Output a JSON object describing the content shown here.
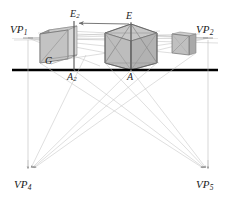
{
  "figure": {
    "kind": "perspective-construction-diagram",
    "width": 230,
    "height": 202,
    "background": "#ffffff"
  },
  "colors": {
    "ground_line": "#000000",
    "construction_line": "#b0b0b0",
    "cube_edge": "#6e6e6e",
    "cube_face_light": "#cfcfcf",
    "cube_face_mid": "#bdbdbd",
    "cube_face_dark": "#a8a8a8",
    "label_text": "#1a1a1a",
    "arrow": "#555555"
  },
  "labels": {
    "vp1": {
      "text": "VP",
      "sub": "1",
      "x": 10,
      "y": 24
    },
    "vp2": {
      "text": "VP",
      "sub": "2",
      "x": 196,
      "y": 24
    },
    "vp4": {
      "text": "VP",
      "sub": "4",
      "x": 14,
      "y": 179
    },
    "vp5": {
      "text": "VP",
      "sub": "5",
      "x": 196,
      "y": 179
    },
    "e_top": {
      "text": "E",
      "sub": "",
      "x": 126,
      "y": 13
    },
    "e2": {
      "text": "E",
      "sub": "2",
      "x": 71,
      "y": 11
    },
    "g": {
      "text": "G",
      "sub": "",
      "x": 46,
      "y": 57
    },
    "a2": {
      "text": "A",
      "sub": "2",
      "x": 68,
      "y": 72
    },
    "a": {
      "text": "A",
      "sub": "",
      "x": 128,
      "y": 72
    }
  },
  "points": {
    "VP1": {
      "x": 28,
      "y": 38
    },
    "VP2": {
      "x": 208,
      "y": 38
    },
    "VP4": {
      "x": 28,
      "y": 172
    },
    "VP5": {
      "x": 208,
      "y": 172
    },
    "E": {
      "x": 131,
      "y": 24
    },
    "E2": {
      "x": 74,
      "y": 23
    },
    "A": {
      "x": 131,
      "y": 70
    },
    "A2": {
      "x": 74,
      "y": 70
    },
    "G": {
      "x": 51,
      "y": 66
    }
  },
  "ground_line": {
    "x1": 12,
    "x2": 218,
    "y": 70,
    "thickness": 2.6
  },
  "verticals": [
    {
      "name": "vp1-vp4-vertical",
      "x": 28,
      "y1": 38,
      "y2": 172
    },
    {
      "name": "vp2-vp5-vertical",
      "x": 208,
      "y1": 38,
      "y2": 172
    },
    {
      "name": "e2-a2-vertical",
      "x": 74,
      "y1": 23,
      "y2": 70
    },
    {
      "name": "e-a-vertical",
      "x": 131,
      "y1": 24,
      "y2": 70
    }
  ],
  "arrow": {
    "name": "e-to-e2-arrow",
    "x1": 129,
    "y1": 24,
    "x2": 78,
    "y2": 23
  },
  "cubes": [
    {
      "name": "left-cube",
      "note": "narrow box, left of picture plane",
      "front_top_left": {
        "x": 40,
        "y": 34
      },
      "front_top_right": {
        "x": 68,
        "y": 30
      },
      "front_bottom_right": {
        "x": 68,
        "y": 59
      },
      "front_bottom_left": {
        "x": 40,
        "y": 63
      },
      "back_offset": {
        "dx": 9,
        "dy": -4
      }
    },
    {
      "name": "center-cube",
      "note": "main cube with diagonals from E",
      "front_top_left": {
        "x": 105,
        "y": 33
      },
      "front_top_right": {
        "x": 157,
        "y": 33
      },
      "front_bottom_right": {
        "x": 157,
        "y": 63
      },
      "front_bottom_left": {
        "x": 105,
        "y": 63
      }
    },
    {
      "name": "right-cube",
      "note": "small distant box",
      "front_top_left": {
        "x": 172,
        "y": 34
      },
      "front_top_right": {
        "x": 195,
        "y": 36
      },
      "front_bottom_right": {
        "x": 195,
        "y": 55
      },
      "front_bottom_left": {
        "x": 172,
        "y": 53
      }
    }
  ]
}
